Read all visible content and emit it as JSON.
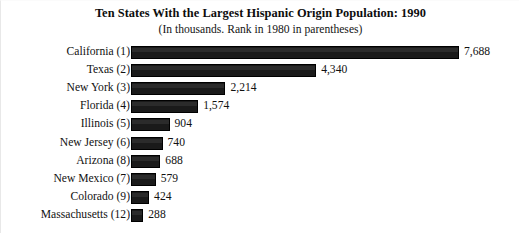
{
  "chart_data": {
    "type": "bar",
    "orientation": "horizontal",
    "title": "Ten States With the Largest Hispanic Origin Population: 1990",
    "subtitle": "(In thousands. Rank in 1980 in parentheses)",
    "xlabel": "",
    "ylabel": "",
    "grid": false,
    "legend": null,
    "units": "thousands",
    "xlim": [
      0,
      7688
    ],
    "categories": [
      "California (1)",
      "Texas (2)",
      "New York (3)",
      "Florida (4)",
      "Illinois (5)",
      "New Jersey (6)",
      "Arizona (8)",
      "New Mexico (7)",
      "Colorado (9)",
      "Massachusetts (12)"
    ],
    "values": [
      7688,
      4340,
      2214,
      1574,
      904,
      740,
      688,
      579,
      424,
      288
    ],
    "value_labels": [
      "7,688",
      "4,340",
      "2,214",
      "1,574",
      "904",
      "740",
      "688",
      "579",
      "424",
      "288"
    ],
    "bar_color": "#1a1a1a"
  },
  "rows": [
    {
      "label": "California (1)",
      "value": 7688,
      "value_label": "7,688"
    },
    {
      "label": "Texas (2)",
      "value": 4340,
      "value_label": "4,340"
    },
    {
      "label": "New York (3)",
      "value": 2214,
      "value_label": "2,214"
    },
    {
      "label": "Florida (4)",
      "value": 1574,
      "value_label": "1,574"
    },
    {
      "label": "Illinois (5)",
      "value": 904,
      "value_label": "904"
    },
    {
      "label": "New Jersey (6)",
      "value": 740,
      "value_label": "740"
    },
    {
      "label": "Arizona (8)",
      "value": 688,
      "value_label": "688"
    },
    {
      "label": "New Mexico (7)",
      "value": 579,
      "value_label": "579"
    },
    {
      "label": "Colorado (9)",
      "value": 424,
      "value_label": "424"
    },
    {
      "label": "Massachusetts (12)",
      "value": 288,
      "value_label": "288"
    }
  ]
}
